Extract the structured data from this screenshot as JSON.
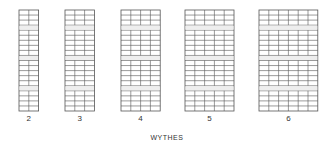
{
  "figure": {
    "axis_title": "WYTHES",
    "line_color": "#555555",
    "header_color": "#777777",
    "walls": [
      {
        "label": "2",
        "wythes": 2,
        "courses": 20,
        "header_courses": [
          3,
          9,
          15
        ]
      },
      {
        "label": "3",
        "wythes": 3,
        "courses": 20,
        "header_courses": [
          3,
          9,
          15
        ]
      },
      {
        "label": "4",
        "wythes": 4,
        "courses": 20,
        "header_courses": [
          3,
          9,
          15
        ]
      },
      {
        "label": "5",
        "wythes": 5,
        "courses": 20,
        "header_courses": [
          3,
          9,
          15
        ]
      },
      {
        "label": "6",
        "wythes": 6,
        "courses": 20,
        "header_courses": [
          3,
          9,
          15
        ]
      }
    ]
  }
}
